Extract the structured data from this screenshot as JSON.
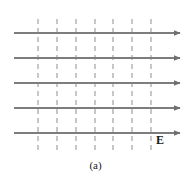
{
  "figure": {
    "name": "uniform-electric-field-diagram",
    "caption": "(a)",
    "field_label": "E",
    "background_color": "#ffffff",
    "field_line_color": "#7d7d7d",
    "equipotential_color": "#b9b9b9",
    "label_color": "#1a1a1a",
    "field_lines": {
      "count": 5,
      "direction": "right",
      "x_start": 14,
      "x_end": 180,
      "y_positions": [
        33,
        58,
        83,
        108,
        133
      ],
      "stroke_width": 2,
      "arrowhead": "solid-triangle"
    },
    "equipotential_lines": {
      "count": 7,
      "orientation": "vertical",
      "style": "dashed",
      "x_positions": [
        38,
        57,
        76,
        95,
        113,
        132,
        151
      ],
      "y_start": 19,
      "y_end": 150,
      "stroke_width": 1.6,
      "dash_pattern": "5 4"
    }
  }
}
